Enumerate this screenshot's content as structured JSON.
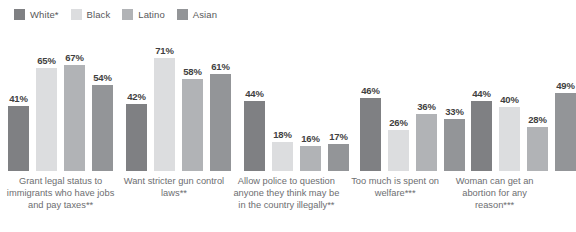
{
  "chart_data": {
    "type": "bar",
    "title": "",
    "xlabel": "",
    "ylabel": "",
    "ylim": [
      0,
      80
    ],
    "grid": false,
    "legend_position": "top-left",
    "categories": [
      "Grant legal status to immigrants who have jobs and pay taxes**",
      "Want stricter gun control laws**",
      "Allow police to question anyone they think may be in the country illegally**",
      "Too much is spent on welfare***",
      "Woman can get an abortion for any reason***"
    ],
    "series": [
      {
        "name": "White*",
        "color": "#7f8083",
        "values": [
          41,
          42,
          44,
          46,
          44
        ]
      },
      {
        "name": "Black",
        "color": "#dcdddf",
        "values": [
          65,
          71,
          18,
          26,
          40
        ]
      },
      {
        "name": "Latino",
        "color": "#b1b3b6",
        "values": [
          67,
          58,
          16,
          36,
          28
        ]
      },
      {
        "name": "Asian",
        "color": "#939598",
        "values": [
          54,
          61,
          17,
          33,
          49
        ]
      }
    ],
    "value_labels": [
      [
        "41%",
        "65%",
        "67%",
        "54%"
      ],
      [
        "42%",
        "71%",
        "58%",
        "61%"
      ],
      [
        "44%",
        "18%",
        "16%",
        "17%"
      ],
      [
        "46%",
        "26%",
        "36%",
        "33%"
      ],
      [
        "44%",
        "40%",
        "28%",
        "49%"
      ]
    ]
  },
  "legend": {
    "items": [
      {
        "label": "White*",
        "color": "#7f8083"
      },
      {
        "label": "Black",
        "color": "#dcdddf"
      },
      {
        "label": "Latino",
        "color": "#b1b3b6"
      },
      {
        "label": "Asian",
        "color": "#939598"
      }
    ]
  },
  "groups": [
    {
      "caption": "Grant legal status to immigrants who have jobs and pay taxes**",
      "bars": [
        {
          "series": "White*",
          "value": 41,
          "label": "41%",
          "color": "#7f8083"
        },
        {
          "series": "Black",
          "value": 65,
          "label": "65%",
          "color": "#dcdddf"
        },
        {
          "series": "Latino",
          "value": 67,
          "label": "67%",
          "color": "#b1b3b6"
        },
        {
          "series": "Asian",
          "value": 54,
          "label": "54%",
          "color": "#939598"
        }
      ]
    },
    {
      "caption": "Want stricter gun control laws**",
      "bars": [
        {
          "series": "White*",
          "value": 42,
          "label": "42%",
          "color": "#7f8083"
        },
        {
          "series": "Black",
          "value": 71,
          "label": "71%",
          "color": "#dcdddf"
        },
        {
          "series": "Latino",
          "value": 58,
          "label": "58%",
          "color": "#b1b3b6"
        },
        {
          "series": "Asian",
          "value": 61,
          "label": "61%",
          "color": "#939598"
        }
      ]
    },
    {
      "caption": "Allow police to question anyone they think may be in the country illegally**",
      "bars": [
        {
          "series": "White*",
          "value": 44,
          "label": "44%",
          "color": "#7f8083"
        },
        {
          "series": "Black",
          "value": 18,
          "label": "18%",
          "color": "#dcdddf"
        },
        {
          "series": "Latino",
          "value": 16,
          "label": "16%",
          "color": "#b1b3b6"
        },
        {
          "series": "Asian",
          "value": 17,
          "label": "17%",
          "color": "#939598"
        }
      ]
    },
    {
      "caption": "Too much is spent on welfare***",
      "bars": [
        {
          "series": "White*",
          "value": 46,
          "label": "46%",
          "color": "#7f8083"
        },
        {
          "series": "Black",
          "value": 26,
          "label": "26%",
          "color": "#dcdddf"
        },
        {
          "series": "Latino",
          "value": 36,
          "label": "36%",
          "color": "#b1b3b6"
        },
        {
          "series": "Asian",
          "value": 33,
          "label": "33%",
          "color": "#939598"
        }
      ]
    },
    {
      "caption": "Woman can get an abortion for any reason***",
      "bars": [
        {
          "series": "White*",
          "value": 44,
          "label": "44%",
          "color": "#7f8083"
        },
        {
          "series": "Black",
          "value": 40,
          "label": "40%",
          "color": "#dcdddf"
        },
        {
          "series": "Latino",
          "value": 28,
          "label": "28%",
          "color": "#b1b3b6"
        },
        {
          "series": "Asian",
          "value": 49,
          "label": "49%",
          "color": "#939598"
        }
      ]
    }
  ],
  "layout": {
    "group_widths": [
      118,
      112,
      110,
      105,
      96
    ],
    "group_lefts": [
      8,
      122,
      234,
      340,
      442
    ],
    "caption_widths": [
      122,
      118,
      120,
      110,
      100
    ],
    "plot_height_px": 145,
    "value_scale_max": 80
  }
}
